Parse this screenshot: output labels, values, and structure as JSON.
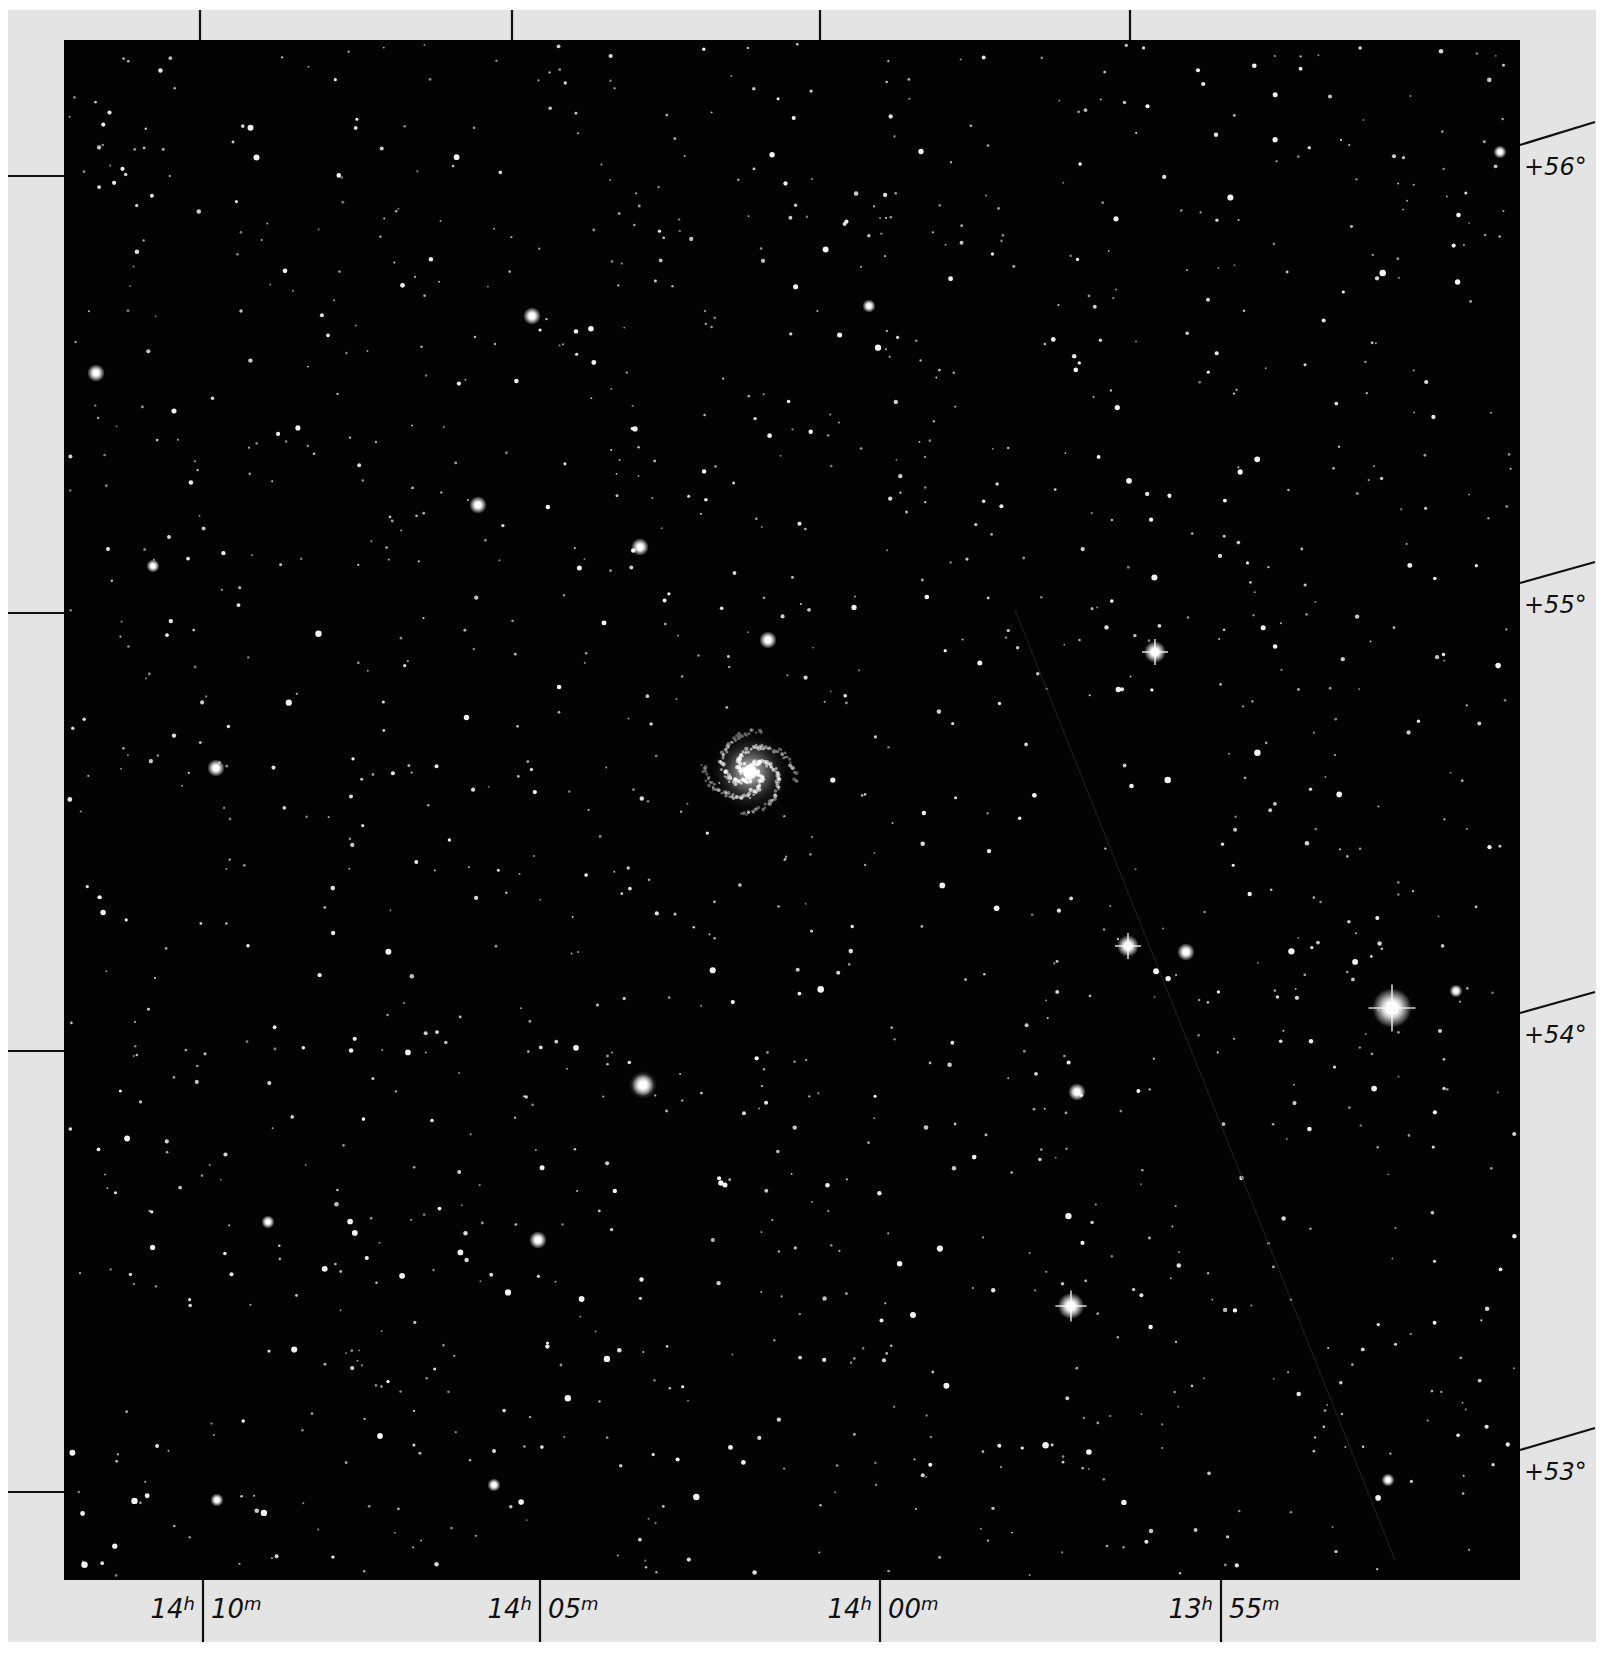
{
  "plate": {
    "width": 1606,
    "height": 1654,
    "colors": {
      "paper": "#e4e4e4",
      "sky": "#030303",
      "ink": "#111111",
      "star": "#ffffff"
    },
    "frame": {
      "x": 64,
      "y": 40,
      "width": 1456,
      "height": 1540
    }
  },
  "axes": {
    "ra_labels": [
      {
        "hours": "14",
        "h": "h",
        "minutes": "10",
        "m": "m",
        "x": 203
      },
      {
        "hours": "14",
        "h": "h",
        "minutes": "05",
        "m": "m",
        "x": 540
      },
      {
        "hours": "14",
        "h": "h",
        "minutes": "00",
        "m": "m",
        "x": 880
      },
      {
        "hours": "13",
        "h": "h",
        "minutes": "55",
        "m": "m",
        "x": 1221
      }
    ],
    "ra_top_ticks_x": [
      200,
      512,
      820,
      1130
    ],
    "dec_labels": [
      {
        "text": "+56°",
        "y_left": 176,
        "y_right_start": 145,
        "y_right_end": 122
      },
      {
        "text": "+55°",
        "y_left": 613,
        "y_right_start": 583,
        "y_right_end": 562
      },
      {
        "text": "+54°",
        "y_left": 1051,
        "y_right_start": 1013,
        "y_right_end": 992
      },
      {
        "text": "+53°",
        "y_left": 1492,
        "y_right_start": 1450,
        "y_right_end": 1428
      }
    ]
  },
  "field": {
    "subject": "spiral galaxy",
    "galaxy": {
      "x": 750,
      "y": 772,
      "radius": 42
    },
    "bright_stars": [
      {
        "x": 1392,
        "y": 1008,
        "r": 9,
        "spikes": true
      },
      {
        "x": 1071,
        "y": 1306,
        "r": 6,
        "spikes": true
      },
      {
        "x": 1128,
        "y": 946,
        "r": 5,
        "spikes": true
      },
      {
        "x": 1186,
        "y": 952,
        "r": 4,
        "spikes": false
      },
      {
        "x": 1155,
        "y": 652,
        "r": 5,
        "spikes": true
      },
      {
        "x": 643,
        "y": 1085,
        "r": 5,
        "spikes": false
      },
      {
        "x": 538,
        "y": 1240,
        "r": 4,
        "spikes": false
      },
      {
        "x": 216,
        "y": 768,
        "r": 4,
        "spikes": false
      },
      {
        "x": 96,
        "y": 373,
        "r": 4,
        "spikes": false
      },
      {
        "x": 532,
        "y": 316,
        "r": 4,
        "spikes": false
      },
      {
        "x": 478,
        "y": 505,
        "r": 4,
        "spikes": false
      },
      {
        "x": 640,
        "y": 547,
        "r": 4,
        "spikes": false
      },
      {
        "x": 768,
        "y": 640,
        "r": 4,
        "spikes": false
      },
      {
        "x": 1077,
        "y": 1092,
        "r": 4,
        "spikes": false
      },
      {
        "x": 1456,
        "y": 991,
        "r": 3,
        "spikes": false
      },
      {
        "x": 1500,
        "y": 152,
        "r": 3,
        "spikes": false
      },
      {
        "x": 153,
        "y": 566,
        "r": 3,
        "spikes": false
      },
      {
        "x": 494,
        "y": 1485,
        "r": 3,
        "spikes": false
      },
      {
        "x": 217,
        "y": 1500,
        "r": 3,
        "spikes": false
      },
      {
        "x": 268,
        "y": 1222,
        "r": 3,
        "spikes": false
      },
      {
        "x": 869,
        "y": 306,
        "r": 3,
        "spikes": false
      },
      {
        "x": 1388,
        "y": 1480,
        "r": 3,
        "spikes": false
      }
    ],
    "fuzzy_objects": [
      {
        "x": 643,
        "y": 1085,
        "r": 14
      }
    ],
    "random_star_count": 1400,
    "random_seed": 101,
    "streak": {
      "x1": 1015,
      "y1": 610,
      "x2": 1395,
      "y2": 1560
    }
  }
}
